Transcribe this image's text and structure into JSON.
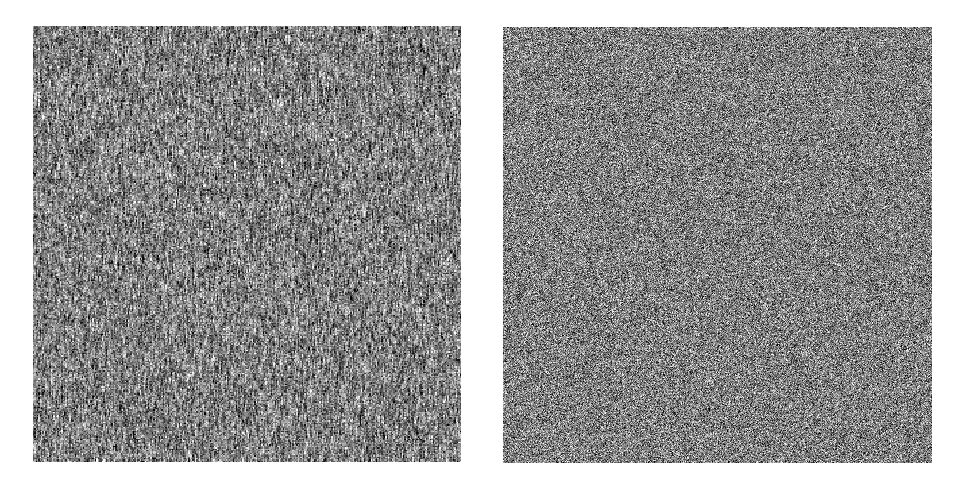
{
  "figure": {
    "background_color": "#ffffff",
    "width": 958,
    "height": 488,
    "title": "",
    "caption": "",
    "panel_count": 2
  },
  "chart_data": {
    "type": "heatmap",
    "title": "",
    "subtitle": "",
    "xlabel": "",
    "ylabel": "",
    "grid": false,
    "legend": "none",
    "colormap": "grayscale",
    "value_range": [
      0,
      255
    ],
    "panels": [
      {
        "name": "left-noise-field",
        "label": "",
        "x": 33,
        "y": 26,
        "width": 428,
        "height": 436,
        "mean_intensity": 128,
        "intensity_std": 58,
        "min_intensity": 0,
        "max_intensity": 255,
        "anisotropy": "vertical",
        "correlation_length_x": 1.1,
        "correlation_length_y": 3.2,
        "grain_scale": 1.35,
        "seed": 1471
      },
      {
        "name": "right-noise-field",
        "label": "",
        "x": 503,
        "y": 27,
        "width": 429,
        "height": 436,
        "mean_intensity": 128,
        "intensity_std": 54,
        "min_intensity": 0,
        "max_intensity": 255,
        "anisotropy": "isotropic",
        "correlation_length_x": 1.0,
        "correlation_length_y": 1.0,
        "grain_scale": 1.0,
        "seed": 90213
      }
    ]
  },
  "panel_left": {
    "caption": "",
    "alt_text": "grayscale noise with vertical streaks"
  },
  "panel_right": {
    "caption": "",
    "alt_text": "fine isotropic grayscale noise"
  }
}
